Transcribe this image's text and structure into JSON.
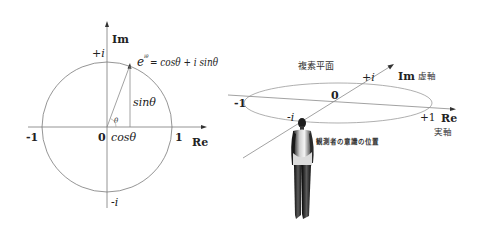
{
  "left_diagram": {
    "axis_labels": {
      "im": "Im",
      "re": "Re"
    },
    "tick_labels": {
      "plus_i": "+i",
      "minus_i": "-i",
      "minus_one": "-1",
      "one": "1",
      "origin": "0"
    },
    "formula": {
      "base": "e",
      "exponent": "iθ",
      "rhs": "= cosθ + i sinθ"
    },
    "sin_label": "sinθ",
    "cos_label": "cosθ",
    "angle_label": "θ"
  },
  "right_diagram": {
    "plane_title": "複素平面",
    "im_axis": {
      "label": "Im",
      "jp_label": "虚軸"
    },
    "re_axis": {
      "label": "Re",
      "jp_label": "実軸"
    },
    "tick_labels": {
      "plus_i": "+i",
      "minus_i": "-i",
      "minus_one": "-1",
      "plus_one": "+1",
      "origin": "0"
    },
    "observer_label": "観測者の意識の位置"
  },
  "colors": {
    "line": "#8a8a8a",
    "text": "#222222",
    "figure_dark": "#1a1a1a",
    "figure_light": "#e8e8e8"
  }
}
